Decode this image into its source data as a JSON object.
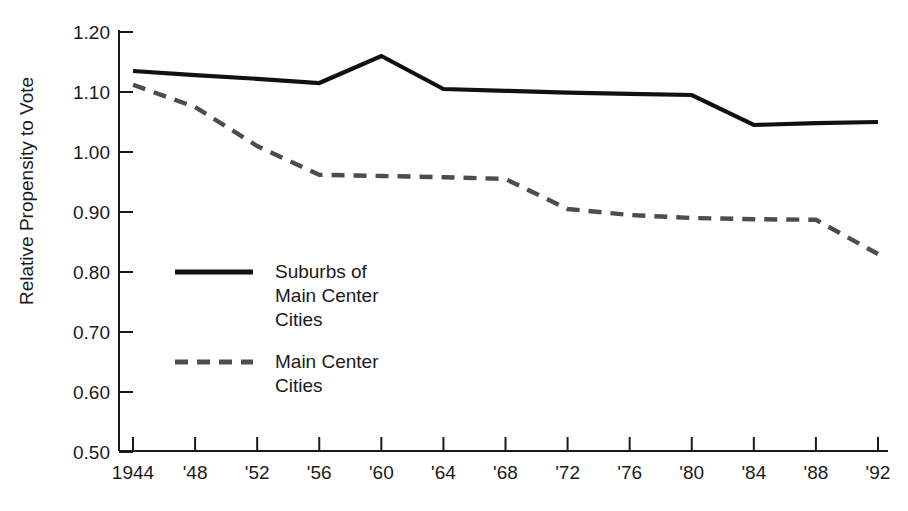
{
  "chart_data": {
    "type": "line",
    "title": "",
    "xlabel": "",
    "ylabel": "Relative Propensity to Vote",
    "x": [
      1944,
      1948,
      1952,
      1956,
      1960,
      1964,
      1968,
      1972,
      1976,
      1980,
      1984,
      1988,
      1992
    ],
    "xtick_labels": [
      "1944",
      "'48",
      "'52",
      "'56",
      "'60",
      "'64",
      "'68",
      "'72",
      "'76",
      "'80",
      "'84",
      "'88",
      "'92"
    ],
    "ytick_labels": [
      "1.20",
      "1.10",
      "1.00",
      "0.90",
      "0.80",
      "0.70",
      "0.60",
      "0.50"
    ],
    "ytick_values": [
      1.2,
      1.1,
      1.0,
      0.9,
      0.8,
      0.7,
      0.6,
      0.5
    ],
    "ylim": [
      0.5,
      1.2
    ],
    "xlim": [
      1944,
      1992
    ],
    "grid": false,
    "legend_position": "center-left-inside",
    "series": [
      {
        "name": "Suburbs of Main Center Cities",
        "style": "solid",
        "color": "#111111",
        "values": [
          1.135,
          1.128,
          1.122,
          1.115,
          1.16,
          1.105,
          1.102,
          1.099,
          1.097,
          1.095,
          1.045,
          1.048,
          1.05
        ]
      },
      {
        "name": "Main Center Cities",
        "style": "dashed",
        "color": "#4d4d4d",
        "values": [
          1.112,
          1.075,
          1.01,
          0.962,
          0.96,
          0.958,
          0.955,
          0.905,
          0.895,
          0.89,
          0.888,
          0.887,
          0.83
        ]
      }
    ]
  },
  "legend": {
    "items": [
      {
        "label_lines": [
          "Suburbs of",
          "Main Center",
          "Cities"
        ],
        "swatch": "solid-line-swatch"
      },
      {
        "label_lines": [
          "Main Center",
          "Cities"
        ],
        "swatch": "dashed-line-swatch"
      }
    ]
  },
  "axis": {
    "y_title": "Relative Propensity to Vote"
  }
}
